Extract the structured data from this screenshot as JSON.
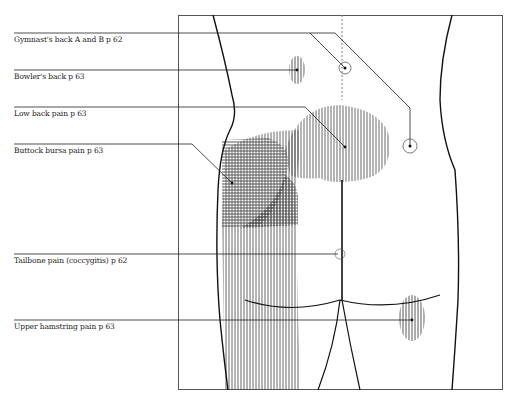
{
  "diagram": {
    "type": "anatomical-figure",
    "view": "back of torso and hips",
    "labels": [
      {
        "id": "gymnasts-back",
        "text": "Gymnast's back A and B p 62"
      },
      {
        "id": "bowlers-back",
        "text": "Bowler's back p 63"
      },
      {
        "id": "low-back-pain",
        "text": "Low back pain p 63"
      },
      {
        "id": "buttock-bursa-pain",
        "text": "Buttock bursa pain p 63"
      },
      {
        "id": "tailbone-pain",
        "text": "Tailbone pain (coccygitis) p 62"
      },
      {
        "id": "upper-hamstring-pain",
        "text": "Upper hamstring pain p 63"
      }
    ],
    "colors": {
      "line": "#222222",
      "hatch": "#555555",
      "frame": "#555555"
    }
  }
}
